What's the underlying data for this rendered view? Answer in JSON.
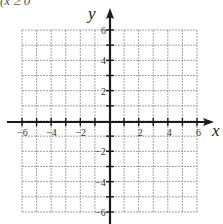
{
  "fragment_text": "(x ≥ 0",
  "chart_data": {
    "type": "table",
    "title": "",
    "xlabel": "x",
    "ylabel": "y",
    "xlim": [
      -6,
      6
    ],
    "ylim": [
      -6,
      6
    ],
    "grid": true,
    "grid_step": 1,
    "x_tick_labels": [
      "-6",
      "-4",
      "-2",
      "2",
      "4",
      "6"
    ],
    "x_tick_values": [
      -6,
      -4,
      -2,
      2,
      4,
      6
    ],
    "y_tick_labels": [
      "6",
      "4",
      "2",
      "-2",
      "-4",
      "-6"
    ],
    "y_tick_values": [
      6,
      4,
      2,
      -2,
      -4,
      -6
    ],
    "series": []
  },
  "layout": {
    "grid_left": 22,
    "grid_right": 197,
    "grid_top": 30,
    "grid_bottom": 212,
    "origin_x": 110,
    "origin_y": 122,
    "axis_x_start": 7,
    "axis_x_end": 214,
    "axis_y_top": 8,
    "axis_y_bottom": 224
  }
}
